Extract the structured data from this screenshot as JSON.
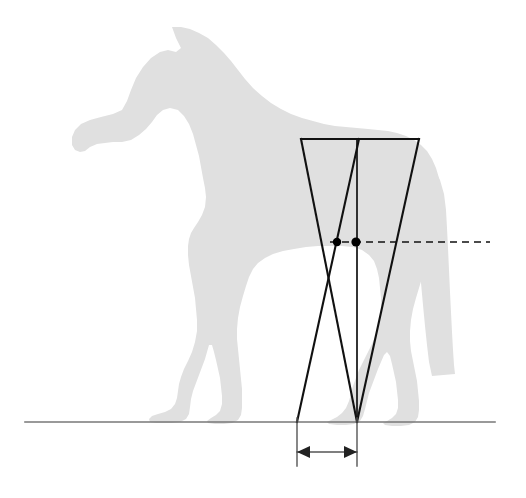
{
  "figure": {
    "canvas": {
      "width": 526,
      "height": 498,
      "background": "#ffffff"
    }
  },
  "colors": {
    "silhouette": "#e0e0e0",
    "construction_line": "#111111",
    "ground_line": "#777777",
    "dimension_line": "#555555",
    "dashed_line": "#111111",
    "marker_dot": "#000000"
  },
  "subject": {
    "name": "horse-silhouette",
    "label": "Horse silhouette, lateral view, facing left",
    "fill": "#e0e0e0",
    "path": "M 172 27 L 176 38 L 181 48 L 176 52 L 168 50 L 160 52 L 151 58 L 143 67 L 136 78 L 131 90 L 127 101 L 122 110 L 113 114 L 101 117 L 90 120 L 81 124 L 75 130 L 72 137 L 72 145 L 75 150 L 80 152 L 85 151 L 90 147 L 97 144 L 105 143 L 113 142 L 122 142 L 131 140 L 139 135 L 146 129 L 152 122 L 157 115 L 163 110 L 170 108 L 178 110 L 184 116 L 189 124 L 193 134 L 196 145 L 199 156 L 201 167 L 203 178 L 205 188 L 206 197 L 205 207 L 202 215 L 198 222 L 194 228 L 191 233 L 189 239 L 188 246 L 188 255 L 189 265 L 191 276 L 193 287 L 195 298 L 196 309 L 197 320 L 197 331 L 195 342 L 192 352 L 188 361 L 184 369 L 181 377 L 179 384 L 178 391 L 177 398 L 175 404 L 171 409 L 165 412 L 158 414 L 152 416 L 149 419 L 150 422 L 156 423 L 164 423 L 172 423 L 180 422 L 186 419 L 189 414 L 190 407 L 191 399 L 193 391 L 196 383 L 199 375 L 202 367 L 205 359 L 207 352 L 209 345 L 212 345 L 214 352 L 216 360 L 218 369 L 220 378 L 221 387 L 222 396 L 222 404 L 220 411 L 216 415 L 211 418 L 207 421 L 208 423 L 215 424 L 224 424 L 232 423 L 238 420 L 241 415 L 242 408 L 242 399 L 242 389 L 241 379 L 240 369 L 239 359 L 238 349 L 237 339 L 237 329 L 238 318 L 240 307 L 243 296 L 246 286 L 249 277 L 253 269 L 258 263 L 265 258 L 273 254 L 283 251 L 294 249 L 306 247 L 318 246 L 330 246 L 342 246 L 353 247 L 362 250 L 369 255 L 374 261 L 377 269 L 379 278 L 380 288 L 381 298 L 381 308 L 380 318 L 378 328 L 375 337 L 371 346 L 367 354 L 363 362 L 359 370 L 356 378 L 353 386 L 351 394 L 349 401 L 346 408 L 342 413 L 337 417 L 331 420 L 327 422 L 329 424 L 337 425 L 346 425 L 354 424 L 360 421 L 363 416 L 365 409 L 367 401 L 369 393 L 372 385 L 375 377 L 378 369 L 381 362 L 384 355 L 387 352 L 390 356 L 392 364 L 394 373 L 396 382 L 397 391 L 398 400 L 398 408 L 396 414 L 392 418 L 387 421 L 383 423 L 385 425 L 392 426 L 401 426 L 409 425 L 415 422 L 418 417 L 419 410 L 419 401 L 418 391 L 417 381 L 415 371 L 413 361 L 411 351 L 410 341 L 410 331 L 411 320 L 413 309 L 416 298 L 419 288 L 422 278 L 426 268 L 430 258 L 434 248 L 437 238 L 439 228 L 441 218 L 442 208 L 442 198 L 441 188 L 439 178 L 436 168 L 432 159 L 427 151 L 421 145 L 414 140 L 406 136 L 397 133 L 388 131 L 378 130 L 368 129 L 357 128 L 346 127 L 335 126 L 324 124 L 313 121 L 302 118 L 291 114 L 281 109 L 271 103 L 262 96 L 253 88 L 245 79 L 238 70 L 231 61 L 224 53 L 216 45 L 208 38 L 199 33 L 190 29 L 181 27 Z",
    "tail": {
      "name": "horse-tail",
      "label": "Tail hanging vertically behind hindquarters",
      "path": "M 424 160 L 433 168 L 440 180 L 444 194 L 446 210 L 447 228 L 448 248 L 449 270 L 450 292 L 451 312 L 452 332 L 453 350 L 454 365 L 455 374 L 432 376 L 429 362 L 427 345 L 425 326 L 423 305 L 421 283 L 419 261 L 417 240 L 415 221 L 413 204 L 411 190 L 410 178 L 412 169 L 417 162 Z"
    }
  },
  "ground_line": {
    "name": "ground-line",
    "label": "Ground reference line",
    "x1": 25,
    "y1": 422,
    "x2": 495,
    "y2": 422,
    "stroke": "#777777",
    "stroke_width": 1.6
  },
  "construction": {
    "label": "Hind limb construction triangle",
    "top_bar": {
      "name": "top-horizontal-bar",
      "label": "Upper horizontal reference bar across croup",
      "x1": 301,
      "y1": 139,
      "x2": 419,
      "y2": 139
    },
    "left_edge": {
      "name": "left-wedge-edge",
      "label": "Left oblique edge from top bar to ground convergence",
      "x1": 301,
      "y1": 139,
      "x2": 357,
      "y2": 422
    },
    "right_edge": {
      "name": "right-wedge-edge",
      "label": "Right oblique edge from top bar to ground convergence",
      "x1": 419,
      "y1": 139,
      "x2": 357,
      "y2": 422
    },
    "inner_oblique": {
      "name": "inner-oblique-line",
      "label": "Inner oblique line crossing from upper plumb toward lower left",
      "x1": 359,
      "y1": 139,
      "x2": 297,
      "y2": 422
    },
    "plumb_line": {
      "name": "vertical-plumb-line",
      "label": "Vertical plumb line dropped to ground convergence point",
      "x1": 357,
      "y1": 139,
      "x2": 357,
      "y2": 422
    },
    "convergence_point": {
      "x": 357,
      "y": 422,
      "label": "Ground convergence point"
    }
  },
  "reference_line": {
    "name": "horizontal-dashed-reference-line",
    "label": "Horizontal dashed reference line through hip level",
    "x1": 330,
    "y1": 242,
    "x2": 490,
    "y2": 242,
    "stroke": "#111111",
    "dash": "7 5"
  },
  "markers": [
    {
      "name": "marker-dot-left",
      "label": "Intersection of inner oblique with reference line",
      "x": 337,
      "y": 242,
      "r": 4.2
    },
    {
      "name": "marker-dot-right",
      "label": "Intersection of plumb line with reference line",
      "x": 356,
      "y": 242,
      "r": 4.6
    }
  ],
  "dimension": {
    "name": "horizontal-offset-dimension",
    "label": "Horizontal offset dimension at ground level",
    "y": 452,
    "left_x": 297,
    "right_x": 357,
    "extension_lines": [
      {
        "name": "extension-line-left",
        "x": 297,
        "y1": 418,
        "y2": 466
      },
      {
        "name": "extension-line-right",
        "x": 357,
        "y1": 418,
        "y2": 466
      }
    ],
    "arrowheads": [
      {
        "name": "arrowhead-left",
        "direction": "left",
        "x": 297,
        "y": 452
      },
      {
        "name": "arrowhead-right",
        "direction": "right",
        "x": 357,
        "y": 452
      }
    ],
    "stroke": "#555555",
    "stroke_width": 1.4
  }
}
